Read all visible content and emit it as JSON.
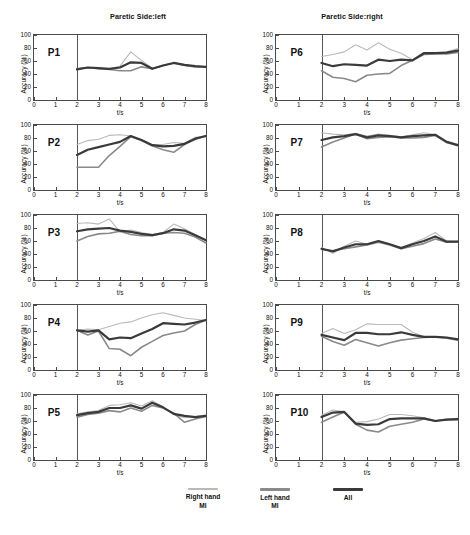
{
  "figure": {
    "columns": [
      {
        "title": "Paretic Side:left"
      },
      {
        "title": "Paretic Side:right"
      }
    ],
    "axis": {
      "ylabel": "Accuracy  (%)",
      "xlabel": "t/s",
      "yticks": [
        0,
        20,
        40,
        60,
        80,
        100
      ],
      "xticks": [
        0,
        1,
        2,
        3,
        4,
        5,
        6,
        7,
        8
      ],
      "ylim": [
        0,
        100
      ],
      "xlim": [
        0,
        8
      ],
      "stimulus_onset": 2
    },
    "legend": [
      {
        "label_line1": "Right hand",
        "label_line2": "MI",
        "color": "#b9b9b9",
        "width": 1.1
      },
      {
        "label_line1": "Left hand",
        "label_line2": "MI",
        "color": "#8a8a8a",
        "width": 1.6
      },
      {
        "label_line1": "All",
        "label_line2": "",
        "color": "#3a3a3a",
        "width": 2.2
      }
    ]
  },
  "chart_data": {
    "type": "line",
    "xlabel": "t/s",
    "ylabel": "Accuracy  (%)",
    "xlim": [
      0,
      8
    ],
    "ylim": [
      0,
      100
    ],
    "grid": false,
    "legend_position": "bottom",
    "x": [
      2,
      2.5,
      3,
      3.5,
      4,
      4.5,
      5,
      5.5,
      6,
      6.5,
      7,
      7.5,
      8
    ],
    "panels": [
      {
        "id": "P1",
        "label": "P1",
        "paretic_side": "left",
        "row": 1,
        "column": "left",
        "series": [
          {
            "name": "Right hand MI",
            "values": [
              47,
              50,
              49,
              48,
              52,
              74,
              61,
              49,
              53,
              57,
              54,
              52,
              51
            ]
          },
          {
            "name": "Left hand MI",
            "values": [
              48,
              50,
              48,
              47,
              45,
              45,
              51,
              48,
              53,
              57,
              53,
              51,
              51
            ]
          },
          {
            "name": "All",
            "values": [
              47,
              50,
              49,
              48,
              50,
              58,
              57,
              48,
              53,
              57,
              54,
              52,
              51
            ]
          }
        ]
      },
      {
        "id": "P2",
        "label": "P2",
        "paretic_side": "left",
        "row": 2,
        "column": "left",
        "series": [
          {
            "name": "Right hand MI",
            "values": [
              70,
              76,
              78,
              84,
              85,
              83,
              77,
              70,
              70,
              73,
              72,
              81,
              82
            ]
          },
          {
            "name": "Left hand MI",
            "values": [
              35,
              35,
              35,
              53,
              67,
              82,
              76,
              68,
              62,
              58,
              70,
              78,
              84
            ]
          },
          {
            "name": "All",
            "values": [
              54,
              62,
              66,
              70,
              74,
              83,
              77,
              69,
              67,
              68,
              71,
              79,
              83
            ]
          }
        ]
      },
      {
        "id": "P3",
        "label": "P3",
        "paretic_side": "left",
        "row": 3,
        "column": "left",
        "series": [
          {
            "name": "Right hand MI",
            "values": [
              87,
              88,
              86,
              94,
              74,
              77,
              73,
              70,
              73,
              86,
              79,
              70,
              61
            ]
          },
          {
            "name": "Left hand MI",
            "values": [
              60,
              67,
              71,
              72,
              75,
              70,
              68,
              68,
              72,
              73,
              72,
              66,
              57
            ]
          },
          {
            "name": "All",
            "values": [
              75,
              78,
              79,
              80,
              76,
              74,
              71,
              69,
              72,
              78,
              76,
              69,
              61
            ]
          }
        ]
      },
      {
        "id": "P4",
        "label": "P4",
        "paretic_side": "left",
        "row": 4,
        "column": "left",
        "series": [
          {
            "name": "Right hand MI",
            "values": [
              61,
              63,
              62,
              67,
              72,
              74,
              80,
              85,
              88,
              84,
              80,
              78,
              76
            ]
          },
          {
            "name": "Left hand MI",
            "values": [
              61,
              54,
              60,
              33,
              32,
              22,
              35,
              44,
              53,
              57,
              60,
              70,
              77
            ]
          },
          {
            "name": "All",
            "values": [
              61,
              59,
              61,
              47,
              50,
              49,
              56,
              63,
              72,
              71,
              70,
              73,
              77
            ]
          }
        ]
      },
      {
        "id": "P5",
        "label": "P5",
        "paretic_side": "left",
        "row": 5,
        "column": "left",
        "series": [
          {
            "name": "Right hand MI",
            "values": [
              71,
              74,
              76,
              84,
              85,
              88,
              83,
              91,
              82,
              70,
              65,
              67,
              69
            ]
          },
          {
            "name": "Left hand MI",
            "values": [
              66,
              70,
              72,
              76,
              74,
              80,
              75,
              84,
              80,
              72,
              58,
              63,
              67
            ]
          },
          {
            "name": "All",
            "values": [
              69,
              72,
              74,
              80,
              80,
              84,
              79,
              88,
              81,
              71,
              68,
              66,
              68
            ]
          }
        ]
      },
      {
        "id": "P6",
        "label": "P6",
        "paretic_side": "right",
        "row": 1,
        "column": "right",
        "series": [
          {
            "name": "Right hand MI",
            "values": [
              67,
              70,
              74,
              85,
              77,
              88,
              78,
              72,
              62,
              73,
              72,
              74,
              79
            ]
          },
          {
            "name": "Left hand MI",
            "values": [
              45,
              35,
              33,
              28,
              38,
              40,
              41,
              53,
              61,
              70,
              71,
              71,
              73
            ]
          },
          {
            "name": "All",
            "values": [
              57,
              52,
              55,
              54,
              53,
              62,
              60,
              62,
              61,
              72,
              72,
              73,
              76
            ]
          }
        ]
      },
      {
        "id": "P7",
        "label": "P7",
        "paretic_side": "right",
        "row": 2,
        "column": "right",
        "series": [
          {
            "name": "Right hand MI",
            "values": [
              88,
              86,
              85,
              87,
              83,
              86,
              84,
              82,
              85,
              88,
              85,
              75,
              69
            ]
          },
          {
            "name": "Left hand MI",
            "values": [
              66,
              74,
              80,
              86,
              79,
              81,
              82,
              80,
              80,
              81,
              84,
              73,
              68
            ]
          },
          {
            "name": "All",
            "values": [
              77,
              81,
              83,
              86,
              81,
              84,
              83,
              81,
              83,
              84,
              85,
              74,
              69
            ]
          }
        ]
      },
      {
        "id": "P8",
        "label": "P8",
        "paretic_side": "right",
        "row": 3,
        "column": "right",
        "series": [
          {
            "name": "Right hand MI",
            "values": [
              50,
              41,
              52,
              60,
              55,
              60,
              55,
              50,
              57,
              64,
              73,
              60,
              59
            ]
          },
          {
            "name": "Left hand MI",
            "values": [
              47,
              45,
              48,
              51,
              54,
              58,
              54,
              48,
              52,
              56,
              63,
              58,
              59
            ]
          },
          {
            "name": "All",
            "values": [
              48,
              44,
              50,
              55,
              55,
              60,
              55,
              49,
              55,
              60,
              67,
              59,
              59
            ]
          }
        ]
      },
      {
        "id": "P9",
        "label": "P9",
        "paretic_side": "right",
        "row": 4,
        "column": "right",
        "series": [
          {
            "name": "Right hand MI",
            "values": [
              56,
              64,
              56,
              62,
              71,
              70,
              70,
              70,
              58,
              51,
              51,
              50,
              47
            ]
          },
          {
            "name": "Left hand MI",
            "values": [
              52,
              44,
              38,
              47,
              42,
              37,
              42,
              46,
              48,
              50,
              51,
              49,
              46
            ]
          },
          {
            "name": "All",
            "values": [
              54,
              50,
              46,
              57,
              57,
              55,
              55,
              58,
              54,
              51,
              51,
              50,
              47
            ]
          }
        ]
      },
      {
        "id": "P10",
        "label": "P10",
        "paretic_side": "right",
        "row": 5,
        "column": "right",
        "series": [
          {
            "name": "Right hand MI",
            "values": [
              69,
              77,
              74,
              58,
              59,
              63,
              70,
              70,
              68,
              65,
              61,
              63,
              64
            ]
          },
          {
            "name": "Left hand MI",
            "values": [
              58,
              66,
              74,
              55,
              46,
              43,
              52,
              55,
              58,
              63,
              60,
              62,
              62
            ]
          },
          {
            "name": "All",
            "values": [
              66,
              73,
              74,
              56,
              54,
              55,
              63,
              64,
              64,
              64,
              60,
              62,
              63
            ]
          }
        ]
      }
    ]
  }
}
